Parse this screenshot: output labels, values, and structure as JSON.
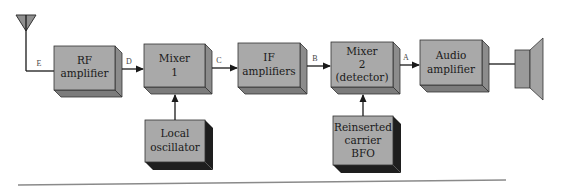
{
  "diagram": {
    "type": "block-diagram",
    "title": "",
    "colors": {
      "block_face": "#a9a9a9",
      "block_side": "#8c8c8c",
      "block_bottom": "#7c7c7c",
      "osc_shadow": "#1e1e1e",
      "line": "#1a1a1a",
      "speaker": "#9a9a9a",
      "baseline": "#8a8a8a"
    },
    "antenna": {
      "label": "antenna"
    },
    "blocks": [
      {
        "id": "rf",
        "lines": [
          "RF",
          "amplifier"
        ]
      },
      {
        "id": "mixer1",
        "lines": [
          "Mixer",
          "1"
        ]
      },
      {
        "id": "if",
        "lines": [
          "IF",
          "amplifiers"
        ]
      },
      {
        "id": "mixer2",
        "lines": [
          "Mixer",
          "2",
          "(detector)"
        ]
      },
      {
        "id": "audio",
        "lines": [
          "Audio",
          "amplifier"
        ]
      },
      {
        "id": "lo",
        "lines": [
          "Local",
          "oscillator"
        ]
      },
      {
        "id": "bfo",
        "lines": [
          "Reinserted",
          "carrier",
          "BFO"
        ]
      }
    ],
    "signals": [
      {
        "label": "E",
        "from": "antenna",
        "to": "rf"
      },
      {
        "label": "D",
        "from": "rf",
        "to": "mixer1"
      },
      {
        "label": "C",
        "from": "mixer1",
        "to": "if"
      },
      {
        "label": "B",
        "from": "if",
        "to": "mixer2"
      },
      {
        "label": "A",
        "from": "mixer2",
        "to": "audio"
      }
    ],
    "extra_connections": [
      {
        "from": "lo",
        "to": "mixer1"
      },
      {
        "from": "bfo",
        "to": "mixer2"
      },
      {
        "from": "audio",
        "to": "speaker"
      }
    ],
    "speaker": {
      "label": "speaker"
    }
  }
}
